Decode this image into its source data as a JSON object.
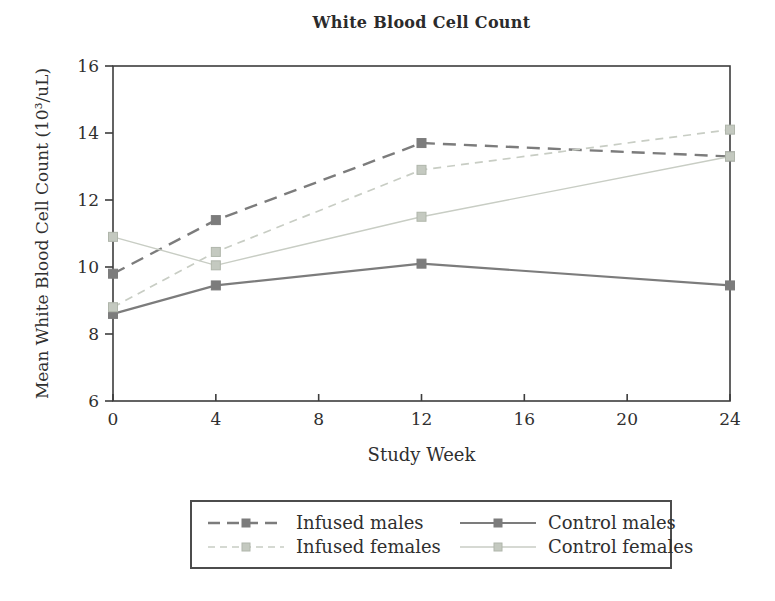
{
  "title": "White Blood Cell Count",
  "colors": {
    "dark_series": "#7c7c7c",
    "light_series": "#c8cdc4",
    "light_marker_fill": "#c4c9c0",
    "light_marker_stroke": "#b0b6ab",
    "axis": "#3d3d3d",
    "text": "#2f2f2f",
    "legend_border": "#4c4c4c",
    "background": "#ffffff"
  },
  "chart_data": {
    "type": "line",
    "title": "White Blood Cell Count",
    "xlabel": "Study Week",
    "ylabel": "Mean White Blood Cell Count (10³/uL)",
    "x": [
      0,
      4,
      12,
      24
    ],
    "xlim": [
      0,
      24
    ],
    "ylim": [
      6,
      16
    ],
    "xticks": [
      0,
      4,
      8,
      12,
      16,
      20,
      24
    ],
    "yticks": [
      6,
      8,
      10,
      12,
      14,
      16
    ],
    "grid": false,
    "plot_border": true,
    "legend_position": "bottom",
    "series": [
      {
        "name": "Infused males",
        "values": [
          9.8,
          11.4,
          13.7,
          13.3
        ],
        "shade": "dark",
        "line": "dashed",
        "marker": "square"
      },
      {
        "name": "Control males",
        "values": [
          8.6,
          9.45,
          10.1,
          9.45
        ],
        "shade": "dark",
        "line": "solid",
        "marker": "square"
      },
      {
        "name": "Infused females",
        "values": [
          8.8,
          10.45,
          12.9,
          14.1
        ],
        "shade": "light",
        "line": "dashed",
        "marker": "square"
      },
      {
        "name": "Control females",
        "values": [
          10.9,
          10.05,
          11.5,
          13.3
        ],
        "shade": "light",
        "line": "solid",
        "marker": "square"
      }
    ],
    "legend_order": [
      "Infused males",
      "Control males",
      "Infused females",
      "Control females"
    ]
  }
}
